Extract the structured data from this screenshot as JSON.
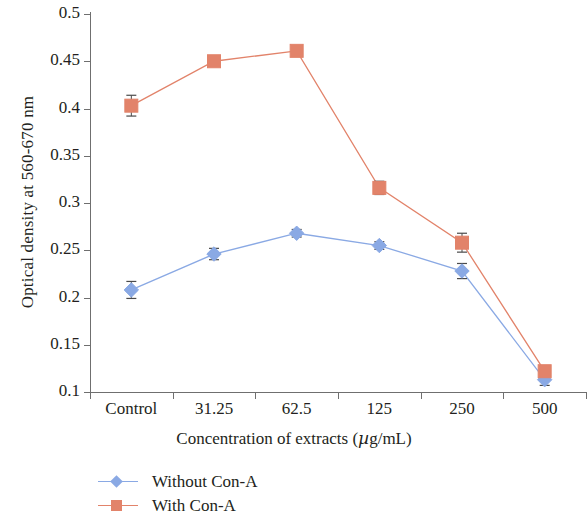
{
  "chart_data": {
    "type": "line",
    "title": "",
    "xlabel": "Concentration of extracts (µg/mL)",
    "ylabel": "Optical density at 560-670 nm",
    "categories": [
      "Control",
      "31.25",
      "62.5",
      "125",
      "250",
      "500"
    ],
    "ylim": [
      0.1,
      0.5
    ],
    "yticks": [
      "0.1",
      "0.15",
      "0.2",
      "0.25",
      "0.3",
      "0.35",
      "0.4",
      "0.45",
      "0.5"
    ],
    "ytick_values": [
      0.1,
      0.15,
      0.2,
      0.25,
      0.3,
      0.35,
      0.4,
      0.45,
      0.5
    ],
    "grid": false,
    "legend_position": "bottom-left",
    "series": [
      {
        "name": "Without Con-A",
        "color": "#8aa9e4",
        "marker": "diamond",
        "values": [
          0.208,
          0.246,
          0.268,
          0.255,
          0.228,
          0.113
        ],
        "errors": [
          0.009,
          0.006,
          0.004,
          0.004,
          0.008,
          0.006
        ]
      },
      {
        "name": "With Con-A",
        "color": "#e2836a",
        "marker": "square",
        "values": [
          0.403,
          0.45,
          0.461,
          0.316,
          0.258,
          0.122
        ],
        "errors": [
          0.011,
          0.004,
          0.003,
          0.007,
          0.01,
          0.005
        ]
      }
    ]
  },
  "axes": {
    "y_title": "Optical density at 560-670 nm",
    "x_title_pre": "Concentration of extracts (",
    "x_title_mu": "µ",
    "x_title_post": "g/mL)"
  },
  "legend": {
    "items": [
      {
        "label": "Without Con-A",
        "marker": "diamond-marker",
        "color": "#8aa9e4"
      },
      {
        "label": "With Con-A",
        "marker": "square-marker",
        "color": "#e2836a"
      }
    ]
  },
  "colors": {
    "without_con_a": "#8aa9e4",
    "with_con_a": "#e2836a",
    "axis": "#6f6f6f",
    "text": "#231f20",
    "error_bar": "#4a4a4a"
  }
}
